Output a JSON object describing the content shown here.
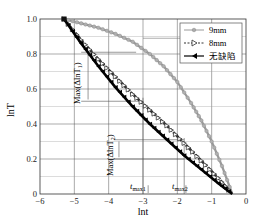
{
  "chart_data": {
    "type": "line",
    "title": "",
    "xlabel": "ln t",
    "ylabel": "ln T",
    "xlim": [
      -6,
      0
    ],
    "ylim": [
      0,
      1.0
    ],
    "xticks": [
      -6,
      -5,
      -4,
      -3,
      -2,
      -1,
      0
    ],
    "xtick_labels": [
      "-6",
      "-5",
      "-4",
      "-3",
      "-2",
      "-1",
      "0"
    ],
    "yticks": [
      0,
      0.2,
      0.4,
      0.6,
      0.8,
      1.0
    ],
    "ytick_labels": [
      "0",
      "0.2",
      "0.4",
      "0.6",
      "0.8",
      "1.0"
    ],
    "grid": true,
    "legend_position": "upper right",
    "series": [
      {
        "name": "9mm",
        "color": "#9a9a9a",
        "marker": "circle",
        "line": "solid",
        "x": [
          -5.3,
          -4.8,
          -4.3,
          -3.8,
          -3.3,
          -2.8,
          -2.4,
          -2.0,
          -1.6,
          -1.3,
          -1.0,
          -0.7,
          -0.4
        ],
        "y": [
          1.0,
          0.975,
          0.95,
          0.915,
          0.87,
          0.8,
          0.73,
          0.64,
          0.52,
          0.42,
          0.3,
          0.16,
          0.0
        ]
      },
      {
        "name": "8mm",
        "color": "#333333",
        "marker": "triangle-right",
        "line": "dashed",
        "x": [
          -5.3,
          -4.8,
          -4.3,
          -3.8,
          -3.3,
          -2.8,
          -2.3,
          -1.8,
          -1.3,
          -0.8,
          -0.4
        ],
        "y": [
          1.0,
          0.88,
          0.77,
          0.67,
          0.57,
          0.48,
          0.39,
          0.29,
          0.19,
          0.09,
          0.0
        ]
      },
      {
        "name": "无缺陷",
        "color": "#000000",
        "marker": "triangle-left",
        "line": "solid",
        "x": [
          -5.3,
          -4.8,
          -4.3,
          -3.8,
          -3.3,
          -2.8,
          -2.3,
          -1.8,
          -1.3,
          -0.8,
          -0.4
        ],
        "y": [
          1.0,
          0.86,
          0.73,
          0.61,
          0.5,
          0.4,
          0.31,
          0.22,
          0.14,
          0.06,
          0.0
        ]
      }
    ],
    "annotations": [
      {
        "text": "Max(ΔlnT₁)",
        "x": -4.8,
        "y_range": [
          0.53,
          0.81
        ],
        "orientation": "vertical"
      },
      {
        "text": "Max(ΔlnT₂)",
        "x": -3.85,
        "y_range": [
          0.2,
          0.31
        ],
        "orientation": "vertical"
      },
      {
        "text": "t_max1",
        "x": -2.85,
        "y": 0.0
      },
      {
        "text": "t_max2",
        "x": -1.75,
        "y": 0.0
      }
    ]
  },
  "legend": {
    "items": [
      {
        "label": "9mm"
      },
      {
        "label": "8mm"
      },
      {
        "label": "无缺陷"
      }
    ]
  },
  "axes": {
    "xlabel": "lnt",
    "ylabel": "lnT"
  },
  "annotations": {
    "max1_label": "Max(ΔlnT",
    "max1_sub": "1",
    "max2_label": "Max(ΔlnT",
    "max2_sub": "2",
    "tmax1_t": "t",
    "tmax1_sub": "max1",
    "tmax2_t": "t",
    "tmax2_sub": "max2"
  }
}
